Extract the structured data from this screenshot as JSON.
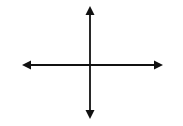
{
  "diagram": {
    "type": "coordinate-axes",
    "color": "#111111",
    "background": "#ffffff",
    "horizontal_axis": {
      "x1": 22,
      "y": 65,
      "x2": 163,
      "arrowheads": "both"
    },
    "vertical_axis": {
      "x": 90,
      "y1": 6,
      "y2": 119,
      "arrowheads": "both"
    },
    "labels": []
  }
}
